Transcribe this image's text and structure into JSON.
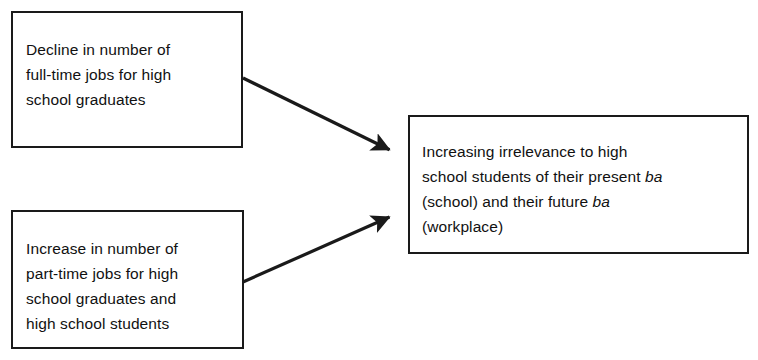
{
  "diagram": {
    "background_color": "#ffffff",
    "line_color": "#1a1a1a",
    "text_color": "#111111",
    "nodes": [
      {
        "id": "decline",
        "name": "decline-in-full-time-jobs-box",
        "text": "Decline in number of\nfull-time jobs for high\nschool graduates",
        "lines": [
          "Decline in number of",
          "full-time jobs for high",
          "school graduates"
        ]
      },
      {
        "id": "increase",
        "name": "increase-in-part-time-jobs-box",
        "text": "Increase in number of\npart-time jobs for high\nschool graduates and\nhigh school students",
        "lines": [
          "Increase in number of",
          "part-time jobs for high",
          "school graduates and",
          "high school students"
        ]
      },
      {
        "id": "irrelevance",
        "name": "increasing-irrelevance-box",
        "lines": [
          "Increasing irrelevance to high",
          "school students of their present ba",
          "(school) and their future ba",
          "(workplace)"
        ],
        "segments": [
          {
            "text": "Increasing irrelevance to high",
            "style": "normal"
          },
          {
            "text": "break",
            "style": "break"
          },
          {
            "text": "school students of their present ",
            "style": "normal"
          },
          {
            "text": "ba",
            "style": "italic"
          },
          {
            "text": "break",
            "style": "break"
          },
          {
            "text": "(school) and their future ",
            "style": "normal"
          },
          {
            "text": "ba",
            "style": "italic"
          },
          {
            "text": "break",
            "style": "break"
          },
          {
            "text": "(workplace)",
            "style": "normal"
          }
        ]
      }
    ],
    "arrows": [
      {
        "id": "arrow-decline-to-irrelevance",
        "name": "arrow-decline-to-irrelevance",
        "from": "decline",
        "to": "irrelevance",
        "x1": 243,
        "y1": 78,
        "x2": 394,
        "y2": 152
      },
      {
        "id": "arrow-increase-to-irrelevance",
        "name": "arrow-increase-to-irrelevance",
        "from": "increase",
        "to": "irrelevance",
        "x1": 243,
        "y1": 282,
        "x2": 394,
        "y2": 215
      }
    ]
  }
}
